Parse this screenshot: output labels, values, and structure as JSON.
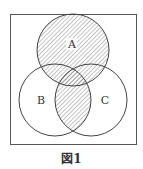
{
  "figure": {
    "caption": "図1",
    "shaded_region": "A ∪ (B ∩ C)",
    "colors": {
      "stroke": "#444444",
      "hatch": "#666666",
      "background": "#ffffff"
    }
  },
  "sets": [
    {
      "label": "A",
      "cx": 73,
      "cy": 50,
      "r": 36
    },
    {
      "label": "B",
      "cx": 55,
      "cy": 100,
      "r": 36
    },
    {
      "label": "C",
      "cx": 91,
      "cy": 100,
      "r": 36
    }
  ]
}
